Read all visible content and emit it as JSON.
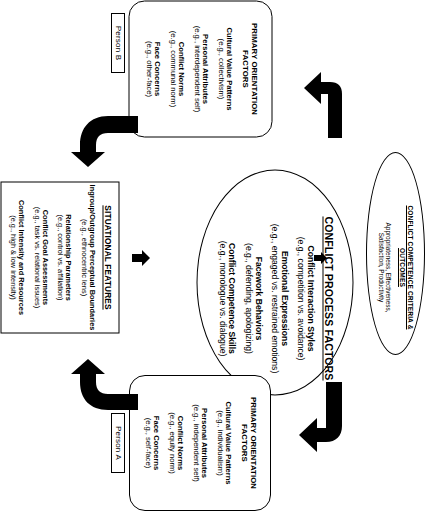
{
  "diagram": {
    "orientation": "rotated-90-clockwise",
    "ink_color": "#000000",
    "background_color": "#ffffff",
    "person_b_tag": "Person B",
    "person_a_tag": "Person A"
  },
  "person_b": {
    "title_line1": "PRIMARY ORIENTATION",
    "title_line2": "FACTORS",
    "items": [
      {
        "label": "Cultural Value Patterns",
        "example": "(e.g., collectivism)"
      },
      {
        "label": "Personal Attributes",
        "example": "(e.g., interdependent self)"
      },
      {
        "label": "Conflict Norms",
        "example": "(e.g., communal norm)"
      },
      {
        "label": "Face Concerns",
        "example": "(e.g., other-face)"
      }
    ]
  },
  "person_a": {
    "title_line1": "PRIMARY ORIENTATION",
    "title_line2": "FACTORS",
    "items": [
      {
        "label": "Cultural Value Patterns",
        "example": "(e.g., individualism)"
      },
      {
        "label": "Personal Attributes",
        "example": "(e.g., independent self)"
      },
      {
        "label": "Conflict Norms",
        "example": "(e.g., equity norm)"
      },
      {
        "label": "Face Concerns",
        "example": "(e.g., self-face)"
      }
    ]
  },
  "situational": {
    "title": "SITUATIONAL FEATURES",
    "items": [
      {
        "label": "Ingroup/Outgroup Perceptual Boundaries",
        "example": "(e.g., ethnocentric lens)"
      },
      {
        "label": "Relationship Parameters",
        "example": "(e.g., control vs. affiliation)"
      },
      {
        "label": "Conflict Goal Assessments",
        "example": "(e.g., task vs. relational issues)"
      },
      {
        "label": "Conflict Intensity and Resources",
        "example": "(e.g., high & low intensity)"
      }
    ]
  },
  "process": {
    "title": "CONFLICT PROCESS FACTORS",
    "items": [
      {
        "label": "Conflict Interaction Styles",
        "example": "(e.g., competition vs. avoidance)"
      },
      {
        "label": "Emotional Expressions",
        "example": "(e.g., engaged vs. restrained emotions)"
      },
      {
        "label": "Facework Behaviors",
        "example": "(e.g., defending, apologizing)"
      },
      {
        "label": "Conflict Competence Skills",
        "example": "(e.g., monologue vs. dialogue)"
      }
    ]
  },
  "outcomes": {
    "title_line1": "CONFLICT COMPETENCE CRITERIA &",
    "title_line2": "OUTCOMES",
    "body_line1": "Appropriateness, Effectiveness,",
    "body_line2": "Satisfaction, Productivity"
  },
  "arrows": [
    {
      "name": "situational-to-process",
      "shape": "straight",
      "direction": "right"
    },
    {
      "name": "process-to-outcomes",
      "shape": "straight",
      "direction": "right"
    },
    {
      "name": "person-b-to-situational",
      "shape": "elbow",
      "direction": "down"
    },
    {
      "name": "outcomes-to-person-b",
      "shape": "elbow",
      "direction": "left"
    },
    {
      "name": "person-a-to-situational",
      "shape": "elbow",
      "direction": "up"
    },
    {
      "name": "outcomes-to-person-a",
      "shape": "elbow",
      "direction": "left"
    }
  ]
}
